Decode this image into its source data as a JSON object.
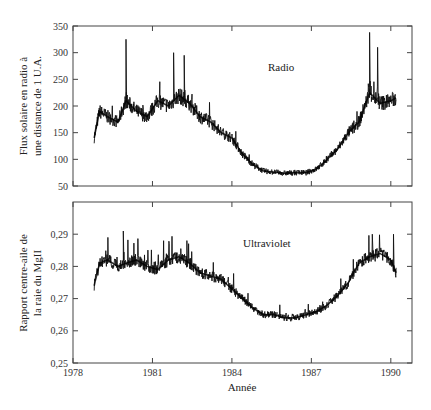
{
  "chart_data": [
    {
      "type": "line",
      "title": "Radio",
      "xlabel": "Année",
      "ylabel": [
        "Flux solaire en radio à",
        "une distance de 1 U.A."
      ],
      "xlim": [
        1978,
        1990.8
      ],
      "ylim": [
        50,
        350
      ],
      "yticks": [
        "350",
        "300",
        "250",
        "200",
        "150",
        "100",
        "50"
      ],
      "yticks_values": [
        350,
        300,
        250,
        200,
        150,
        100,
        50
      ],
      "grid": false,
      "legend": "none",
      "series": [
        {
          "name": "Radio flux (10.7 cm)",
          "x": [
            1978.8,
            1979.0,
            1979.3,
            1979.7,
            1980.0,
            1980.4,
            1980.8,
            1981.2,
            1981.6,
            1982.0,
            1982.4,
            1982.8,
            1983.2,
            1983.6,
            1984.0,
            1984.4,
            1984.8,
            1985.2,
            1985.6,
            1986.0,
            1986.4,
            1986.8,
            1987.2,
            1987.6,
            1988.0,
            1988.4,
            1988.8,
            1989.2,
            1989.6,
            1990.0,
            1990.2
          ],
          "values": [
            140,
            190,
            180,
            170,
            210,
            190,
            180,
            210,
            200,
            220,
            205,
            180,
            170,
            150,
            140,
            110,
            90,
            78,
            76,
            74,
            75,
            75,
            82,
            100,
            120,
            150,
            170,
            225,
            205,
            210,
            215
          ],
          "peak_spikes": [
            [
              1980.0,
              325
            ],
            [
              1981.8,
              300
            ],
            [
              1982.2,
              295
            ],
            [
              1989.2,
              338
            ],
            [
              1989.5,
              310
            ]
          ]
        }
      ]
    },
    {
      "type": "line",
      "title": "Ultraviolet",
      "xlabel": "Année",
      "ylabel": [
        "Rapport centre-aile de",
        "la raie du MgII"
      ],
      "xlim": [
        1978,
        1990.8
      ],
      "ylim": [
        0.25,
        0.3
      ],
      "yticks": [
        "0,29",
        "0,28",
        "0,27",
        "0,26",
        "0,25"
      ],
      "yticks_values": [
        0.29,
        0.28,
        0.27,
        0.26,
        0.25
      ],
      "grid": false,
      "legend": "none",
      "series": [
        {
          "name": "MgII core-to-wing ratio",
          "x": [
            1978.8,
            1979.0,
            1979.3,
            1979.7,
            1980.0,
            1980.4,
            1980.8,
            1981.2,
            1981.6,
            1982.0,
            1982.4,
            1982.8,
            1983.2,
            1983.6,
            1984.0,
            1984.4,
            1984.8,
            1985.2,
            1985.6,
            1986.0,
            1986.4,
            1986.8,
            1987.2,
            1987.6,
            1988.0,
            1988.4,
            1988.8,
            1989.2,
            1989.6,
            1990.0,
            1990.2
          ],
          "values": [
            0.274,
            0.281,
            0.282,
            0.28,
            0.281,
            0.282,
            0.28,
            0.279,
            0.282,
            0.283,
            0.281,
            0.278,
            0.277,
            0.276,
            0.273,
            0.27,
            0.267,
            0.265,
            0.265,
            0.264,
            0.264,
            0.265,
            0.266,
            0.268,
            0.271,
            0.275,
            0.281,
            0.283,
            0.284,
            0.282,
            0.278
          ],
          "peak_spikes": [
            [
              1979.9,
              0.291
            ],
            [
              1982.3,
              0.288
            ],
            [
              1989.3,
              0.29
            ],
            [
              1990.1,
              0.29
            ]
          ]
        }
      ]
    }
  ],
  "xaxis": {
    "ticks": [
      "1978",
      "1981",
      "1984",
      "1987",
      "1990"
    ],
    "tick_values": [
      1978,
      1981,
      1984,
      1987,
      1990
    ],
    "title": "Année"
  },
  "panels": {
    "top_label": "Radio",
    "bottom_label": "Ultraviolet"
  }
}
